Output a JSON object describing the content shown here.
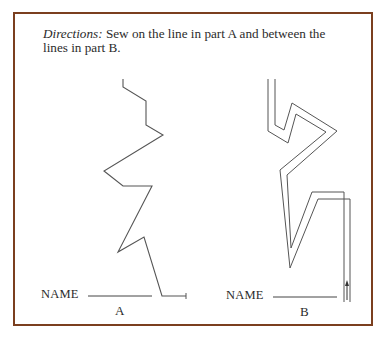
{
  "directions": {
    "lead": "Directions:",
    "text": " Sew on the line in part A and between the lines in part B."
  },
  "parts": [
    {
      "name_label": "NAME",
      "part_label": "A"
    },
    {
      "name_label": "NAME",
      "part_label": "B"
    }
  ],
  "colors": {
    "frame": "#7b3f1f",
    "lines": "#555555"
  }
}
